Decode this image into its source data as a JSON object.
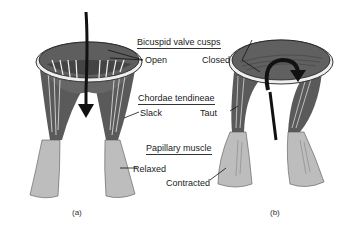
{
  "diagram": {
    "headings": {
      "cusps": "Bicuspid valve cusps",
      "chordae": "Chordae tendineae",
      "papillary": "Papillary muscle"
    },
    "panel_a": {
      "label": "(a)",
      "cusps_state": "Open",
      "chordae_state": "Slack",
      "muscle_state": "Relaxed",
      "flow_arrow": "down-arrow"
    },
    "panel_b": {
      "label": "(b)",
      "cusps_state": "Closed",
      "chordae_state": "Taut",
      "muscle_state": "Contracted",
      "flow_arrow": "curved-arrow"
    },
    "colors": {
      "tissue_dark": "#555555",
      "tissue_mid": "#7a7a7a",
      "muscle": "#b9b9b9",
      "ring": "#e8e8e8",
      "arrow": "#111111",
      "text": "#1a1a1a"
    }
  }
}
